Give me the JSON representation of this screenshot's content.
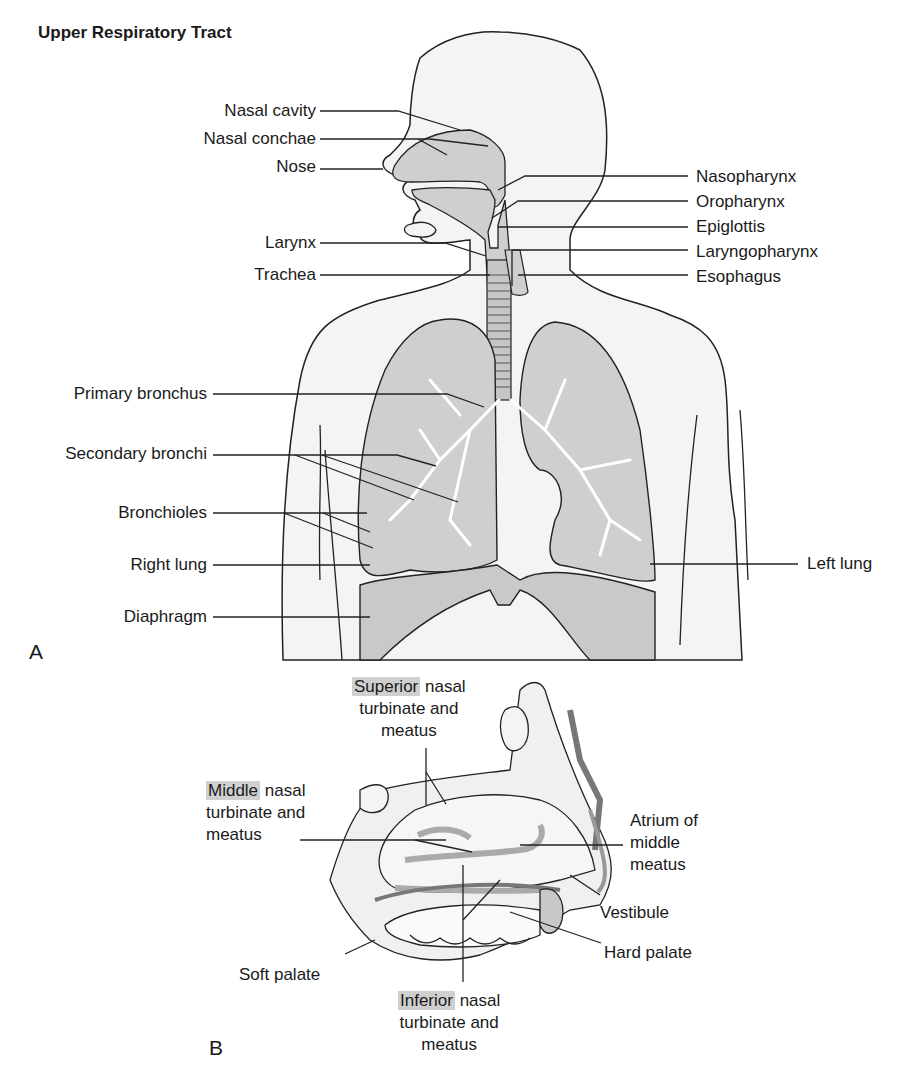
{
  "title": "Upper Respiratory Tract",
  "panel_a": {
    "letter": "A",
    "labels_left": {
      "nasal_cavity": "Nasal cavity",
      "nasal_conchae": "Nasal conchae",
      "nose": "Nose",
      "larynx": "Larynx",
      "trachea": "Trachea",
      "primary_bronchus": "Primary bronchus",
      "secondary_bronchi": "Secondary bronchi",
      "bronchioles": "Bronchioles",
      "right_lung": "Right lung",
      "diaphragm": "Diaphragm"
    },
    "labels_right": {
      "nasopharynx": "Nasopharynx",
      "oropharynx": "Oropharynx",
      "epiglottis": "Epiglottis",
      "laryngopharynx": "Laryngopharynx",
      "esophagus": "Esophagus",
      "left_lung": "Left lung"
    }
  },
  "panel_b": {
    "letter": "B",
    "superior": {
      "highlight": "Superior",
      "rest1": " nasal",
      "line2": "turbinate and",
      "line3": "meatus"
    },
    "middle": {
      "highlight": "Middle",
      "rest1": " nasal",
      "line2": "turbinate and",
      "line3": "meatus"
    },
    "inferior": {
      "highlight": "Inferior",
      "rest1": " nasal",
      "line2": "turbinate and",
      "line3": "meatus"
    },
    "atrium": {
      "line1": "Atrium of",
      "line2": "middle",
      "line3": "meatus"
    },
    "vestibule": "Vestibule",
    "hard_palate": "Hard palate",
    "soft_palate": "Soft palate"
  },
  "colors": {
    "body_fill": "#f4f4f4",
    "organ_fill": "#cfcfcf",
    "dark_fill": "#a9a9a9",
    "line": "#222222",
    "highlight": "#cfcfcf"
  }
}
